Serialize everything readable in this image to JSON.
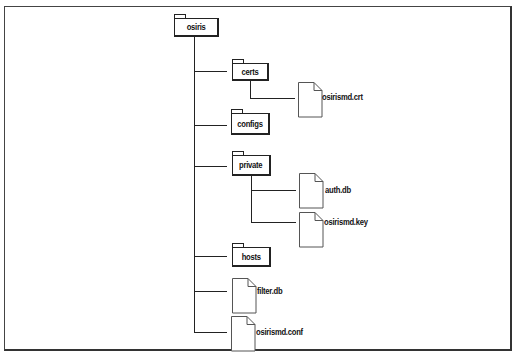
{
  "diagram": {
    "type": "directory-tree",
    "root": {
      "name": "osiris",
      "kind": "folder",
      "children": [
        {
          "name": "certs",
          "kind": "folder",
          "children": [
            {
              "name": "osirismd.crt",
              "kind": "file"
            }
          ]
        },
        {
          "name": "configs",
          "kind": "folder",
          "children": []
        },
        {
          "name": "private",
          "kind": "folder",
          "children": [
            {
              "name": "auth.db",
              "kind": "file"
            },
            {
              "name": "osirismd.key",
              "kind": "file"
            }
          ]
        },
        {
          "name": "hosts",
          "kind": "folder",
          "children": []
        },
        {
          "name": "filter.db",
          "kind": "file"
        },
        {
          "name": "osirismd.conf",
          "kind": "file"
        }
      ]
    }
  },
  "labels": {
    "root": "osiris",
    "certs": "certs",
    "certs_file": "osirismd.crt",
    "configs": "configs",
    "private": "private",
    "private_file_1": "auth.db",
    "private_file_2": "osirismd.key",
    "hosts": "hosts",
    "file_filter": "filter.db",
    "file_conf": "osirismd.conf"
  },
  "colors": {
    "stroke": "#222222",
    "background": "#ffffff"
  }
}
